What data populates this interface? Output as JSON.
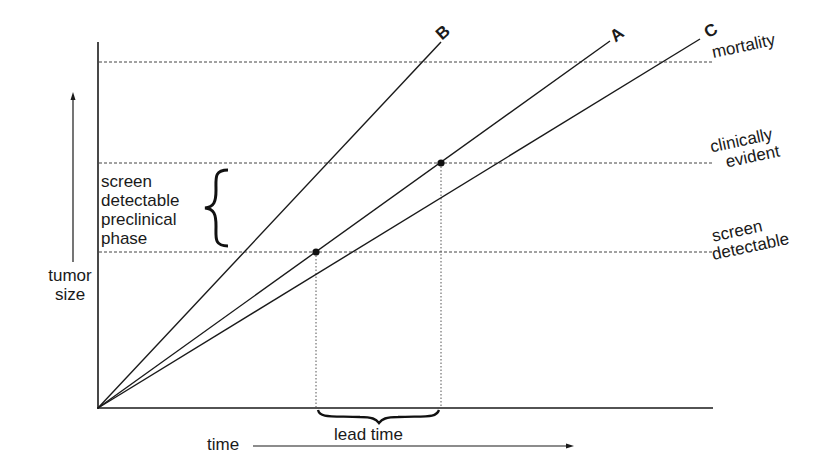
{
  "diagram": {
    "y_axis_label": [
      "tumor",
      "size"
    ],
    "x_axis_label": "time",
    "lines": [
      {
        "label": "B",
        "x1": 98,
        "y1": 408,
        "x2": 441,
        "y2": 42
      },
      {
        "label": "A",
        "x1": 98,
        "y1": 408,
        "x2": 610,
        "y2": 41
      },
      {
        "label": "C",
        "x1": 98,
        "y1": 408,
        "x2": 700,
        "y2": 39
      }
    ],
    "thresholds": [
      {
        "label": "mortality",
        "y": 62
      },
      {
        "label": "clinically evident",
        "label_lines": [
          "clinically",
          "evident"
        ],
        "y": 163
      },
      {
        "label": "screen detectable",
        "label_lines": [
          "screen",
          "detectable"
        ],
        "y": 252
      }
    ],
    "phase_label": [
      "screen",
      "detectable",
      "preclinical",
      "phase"
    ],
    "lead_time_label": "lead time",
    "points": [
      {
        "name": "screen-detectable-point",
        "x": 316,
        "y": 252
      },
      {
        "name": "clinically-evident-point",
        "x": 441,
        "y": 163
      }
    ],
    "line_color": "#1a1a1a",
    "dash_color": "#444444"
  }
}
